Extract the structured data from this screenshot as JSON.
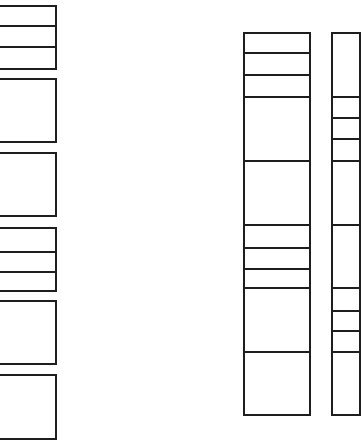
{
  "diagram": {
    "type": "shelving-elevation",
    "line_color": "#1e1e1e",
    "background": "#ffffff",
    "columns": [
      {
        "name": "left-column",
        "x": -4,
        "width": 61,
        "cells": [
          {
            "top": 5,
            "height": 22
          },
          {
            "top": 25,
            "height": 23
          },
          {
            "top": 46,
            "height": 24
          },
          {
            "top": 78,
            "height": 65
          },
          {
            "top": 152,
            "height": 65
          },
          {
            "top": 227,
            "height": 26
          },
          {
            "top": 251,
            "height": 22
          },
          {
            "top": 271,
            "height": 21
          },
          {
            "top": 300,
            "height": 65
          },
          {
            "top": 374,
            "height": 66
          }
        ]
      },
      {
        "name": "middle-column",
        "x": 243,
        "width": 68,
        "cells": [
          {
            "top": 32,
            "height": 22
          },
          {
            "top": 52,
            "height": 24
          },
          {
            "top": 74,
            "height": 24
          },
          {
            "top": 96,
            "height": 66
          },
          {
            "top": 160,
            "height": 66
          },
          {
            "top": 224,
            "height": 25
          },
          {
            "top": 247,
            "height": 23
          },
          {
            "top": 268,
            "height": 21
          },
          {
            "top": 287,
            "height": 66
          },
          {
            "top": 351,
            "height": 65
          }
        ]
      },
      {
        "name": "right-column",
        "x": 331,
        "width": 30,
        "cells": [
          {
            "top": 32,
            "height": 66
          },
          {
            "top": 96,
            "height": 23
          },
          {
            "top": 117,
            "height": 23
          },
          {
            "top": 138,
            "height": 24
          },
          {
            "top": 160,
            "height": 66
          },
          {
            "top": 224,
            "height": 65
          },
          {
            "top": 287,
            "height": 25
          },
          {
            "top": 310,
            "height": 22
          },
          {
            "top": 330,
            "height": 23
          },
          {
            "top": 351,
            "height": 65
          }
        ]
      }
    ]
  }
}
